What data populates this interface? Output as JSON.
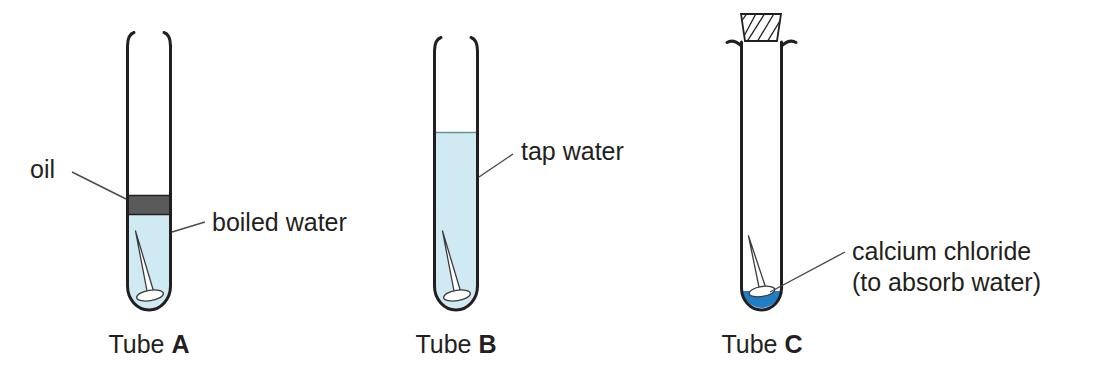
{
  "diagram": {
    "background_color": "#ffffff",
    "line_color": "#231f20",
    "leader_color": "#4a4a4a"
  },
  "colors": {
    "water_light": "#cfeaf2",
    "water_light_edge": "#b9dfe9",
    "oil_gray": "#5a5a5a",
    "calcium_chloride_blue": "#1f7ec4",
    "nail_white": "#ffffff",
    "ink": "#231f20"
  },
  "tubes": [
    {
      "id": "tube-a",
      "caption_prefix": "Tube ",
      "caption_letter": "A",
      "contents": [
        {
          "name": "oil",
          "label": "oil",
          "color": "#5a5a5a"
        },
        {
          "name": "boiled-water",
          "label": "boiled water",
          "color": "#cfeaf2"
        },
        {
          "name": "iron-nail",
          "label": "nail",
          "color": "#ffffff"
        }
      ],
      "stopper": false,
      "fill_level": "partial"
    },
    {
      "id": "tube-b",
      "caption_prefix": "Tube ",
      "caption_letter": "B",
      "contents": [
        {
          "name": "tap-water",
          "label": "tap water",
          "color": "#cfeaf2"
        },
        {
          "name": "iron-nail",
          "label": "nail",
          "color": "#ffffff"
        }
      ],
      "stopper": false,
      "fill_level": "high"
    },
    {
      "id": "tube-c",
      "caption_prefix": "Tube ",
      "caption_letter": "C",
      "contents": [
        {
          "name": "calcium-chloride",
          "label": "calcium chloride",
          "sublabel": "(to absorb water)",
          "color": "#1f7ec4"
        },
        {
          "name": "iron-nail",
          "label": "nail",
          "color": "#ffffff"
        }
      ],
      "stopper": true,
      "stopper_name": "rubber-bung",
      "fill_level": "trace"
    }
  ],
  "labels": {
    "oil": "oil",
    "boiled_water": "boiled water",
    "tap_water": "tap water",
    "calcium_chloride_line1": "calcium chloride",
    "calcium_chloride_line2": "(to absorb water)"
  },
  "captions": {
    "a_prefix": "Tube ",
    "a_letter": "A",
    "b_prefix": "Tube ",
    "b_letter": "B",
    "c_prefix": "Tube ",
    "c_letter": "C"
  }
}
